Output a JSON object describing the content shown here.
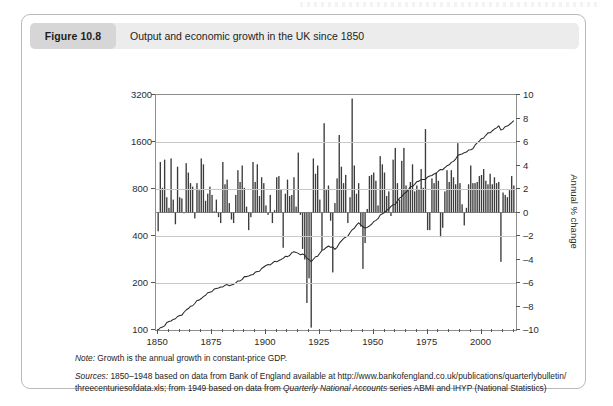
{
  "figure": {
    "tag": "Figure 10.8",
    "caption": "Output and economic growth in the UK since 1850"
  },
  "notes": {
    "note_lead": "Note:",
    "note_text": " Growth is the annual growth in constant-price GDP.",
    "sources_lead": "Sources:",
    "sources_line1": " 1850–1948 based on data from Bank of England available at http://www.bankofengland.co.uk/publications/quarterlybulletin/",
    "sources_line2_a": "threecenturiesofdata.xls; from 1949 based on data from ",
    "sources_line2_italic": "Quarterly National Accounts",
    "sources_line2_b": " series ABMI and IHYP (National Statistics)"
  },
  "chart_data": {
    "type": "bar",
    "title": "Output and economic growth in the UK since 1850",
    "xlabel": "",
    "ylabel": "Real GDP, 1850 = 100 (log scale)",
    "ylabel_right": "Annual % change",
    "xlim": [
      1849,
      2016
    ],
    "xticks": [
      1850,
      1875,
      1900,
      1925,
      1950,
      1975,
      2000
    ],
    "xminor_step": 5,
    "grid": true,
    "legend": "none",
    "left_axis": {
      "scale": "log",
      "ticks": [
        100,
        200,
        400,
        800,
        1600,
        3200
      ],
      "ylim": [
        100,
        3200
      ]
    },
    "right_axis": {
      "scale": "linear",
      "ticks": [
        -10,
        -8,
        -6,
        -4,
        -2,
        0,
        2,
        4,
        6,
        8,
        10
      ],
      "ylim": [
        -10,
        10
      ]
    },
    "colors": {
      "bar": "#3c3c3c",
      "line": "#2a2a2a",
      "grid": "#c8c8c8",
      "axis": "#8d8d8d",
      "caption_bar": "#ececec",
      "figure_tag": "#d6d6d6"
    },
    "series": [
      {
        "name": "Annual % change",
        "type": "bar",
        "axis": "right",
        "x": [
          1850,
          1851,
          1852,
          1853,
          1854,
          1855,
          1856,
          1857,
          1858,
          1859,
          1860,
          1861,
          1862,
          1863,
          1864,
          1865,
          1866,
          1867,
          1868,
          1869,
          1870,
          1871,
          1872,
          1873,
          1874,
          1875,
          1876,
          1877,
          1878,
          1879,
          1880,
          1881,
          1882,
          1883,
          1884,
          1885,
          1886,
          1887,
          1888,
          1889,
          1890,
          1891,
          1892,
          1893,
          1894,
          1895,
          1896,
          1897,
          1898,
          1899,
          1900,
          1901,
          1902,
          1903,
          1904,
          1905,
          1906,
          1907,
          1908,
          1909,
          1910,
          1911,
          1912,
          1913,
          1914,
          1915,
          1916,
          1917,
          1918,
          1919,
          1920,
          1921,
          1922,
          1923,
          1924,
          1925,
          1926,
          1927,
          1928,
          1929,
          1930,
          1931,
          1932,
          1933,
          1934,
          1935,
          1936,
          1937,
          1938,
          1939,
          1940,
          1941,
          1942,
          1943,
          1944,
          1945,
          1946,
          1947,
          1948,
          1949,
          1950,
          1951,
          1952,
          1953,
          1954,
          1955,
          1956,
          1957,
          1958,
          1959,
          1960,
          1961,
          1962,
          1963,
          1964,
          1965,
          1966,
          1967,
          1968,
          1969,
          1970,
          1971,
          1972,
          1973,
          1974,
          1975,
          1976,
          1977,
          1978,
          1979,
          1980,
          1981,
          1982,
          1983,
          1984,
          1985,
          1986,
          1987,
          1988,
          1989,
          1990,
          1991,
          1992,
          1993,
          1994,
          1995,
          1996,
          1997,
          1998,
          1999,
          2000,
          2001,
          2002,
          2003,
          2004,
          2005,
          2006,
          2007,
          2008,
          2009,
          2010,
          2011,
          2012,
          2013,
          2014,
          2015
        ],
        "values": [
          -1.6,
          4.3,
          2.1,
          4.5,
          1.3,
          0.4,
          4.6,
          1.1,
          -1.0,
          3.9,
          1.3,
          1.2,
          0.0,
          4.2,
          3.4,
          2.5,
          2.2,
          -0.5,
          2.5,
          1.9,
          4.6,
          4.1,
          1.0,
          1.6,
          2.2,
          1.5,
          0.1,
          1.1,
          -0.4,
          -0.9,
          4.3,
          2.4,
          2.8,
          0.8,
          -0.6,
          -0.9,
          1.5,
          3.6,
          2.6,
          4.0,
          2.1,
          0.5,
          -1.5,
          -0.4,
          4.3,
          2.6,
          4.1,
          1.4,
          3.0,
          2.5,
          0.6,
          -0.2,
          1.5,
          -0.9,
          0.2,
          3.0,
          3.1,
          2.0,
          -3.0,
          1.6,
          2.8,
          1.4,
          1.5,
          3.0,
          0.5,
          5.1,
          -0.2,
          -3.1,
          -4.0,
          -7.7,
          -5.6,
          -9.8,
          4.6,
          3.3,
          4.0,
          1.1,
          -3.2,
          7.6,
          2.0,
          2.3,
          -0.7,
          -5.1,
          0.8,
          2.9,
          6.6,
          3.9,
          2.5,
          3.2,
          -0.9,
          1.3,
          9.7,
          4.0,
          1.6,
          2.5,
          -1.2,
          -4.8,
          -2.6,
          0.3,
          3.1,
          3.2,
          3.4,
          2.7,
          0.6,
          4.8,
          4.1,
          3.4,
          1.4,
          1.8,
          -0.3,
          4.5,
          5.5,
          2.5,
          1.1,
          4.4,
          5.5,
          2.3,
          1.9,
          2.6,
          4.1,
          1.8,
          2.3,
          2.0,
          3.7,
          2.1,
          7.1,
          -1.5,
          -1.5,
          2.9,
          2.5,
          3.4,
          2.7,
          -2.1,
          -1.3,
          1.8,
          3.6,
          2.6,
          3.6,
          3.0,
          2.4,
          5.9,
          2.5,
          0.7,
          -1.1,
          0.4,
          2.4,
          4.0,
          2.5,
          2.5,
          2.6,
          3.1,
          3.2,
          3.7,
          2.7,
          2.4,
          3.3,
          2.4,
          3.0,
          2.5,
          2.6,
          -4.2,
          1.7,
          1.5,
          1.3,
          1.9,
          3.1,
          2.3
        ]
      },
      {
        "name": "Real GDP, 1850 = 100",
        "type": "line",
        "axis": "left",
        "x": [
          1850,
          1855,
          1860,
          1865,
          1870,
          1875,
          1880,
          1885,
          1890,
          1895,
          1900,
          1905,
          1910,
          1913,
          1918,
          1921,
          1925,
          1929,
          1932,
          1935,
          1939,
          1943,
          1945,
          1948,
          1950,
          1955,
          1960,
          1965,
          1970,
          1975,
          1980,
          1985,
          1990,
          1995,
          2000,
          2005,
          2008,
          2009,
          2012,
          2015
        ],
        "values": [
          100,
          113,
          123,
          141,
          160,
          179,
          191,
          196,
          217,
          231,
          258,
          275,
          297,
          317,
          300,
          274,
          311,
          347,
          329,
          372,
          417,
          489,
          452,
          460,
          492,
          570,
          646,
          769,
          888,
          946,
          1036,
          1142,
          1331,
          1423,
          1676,
          1896,
          2010,
          1925,
          2020,
          2190
        ]
      }
    ]
  }
}
